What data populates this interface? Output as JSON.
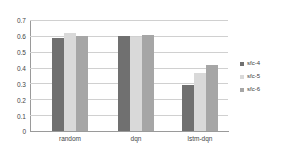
{
  "chart_data": {
    "type": "bar",
    "title": "",
    "subtitle": "",
    "xlabel": "",
    "ylabel": "",
    "categories": [
      "random",
      "dqn",
      "lstm-dqn"
    ],
    "series": [
      {
        "name": "sfc-4",
        "color": "#707070",
        "values": [
          0.585,
          0.6,
          0.29
        ]
      },
      {
        "name": "sfc-5",
        "color": "#d9d9d9",
        "values": [
          0.62,
          0.595,
          0.365
        ]
      },
      {
        "name": "sfc-6",
        "color": "#a6a6a6",
        "values": [
          0.6,
          0.605,
          0.415
        ]
      }
    ],
    "ylim": [
      0,
      0.7
    ],
    "ytick_labels": [
      "0",
      "0.1",
      "0.2",
      "0.3",
      "0.4",
      "0.5",
      "0.6",
      "0.7"
    ],
    "ytick_values": [
      0,
      0.1,
      0.2,
      0.3,
      0.4,
      0.5,
      0.6,
      0.7
    ],
    "grid": true,
    "grid_axis": "y",
    "legend_position": "right",
    "background_color": "#ffffff",
    "axis_color": "#9a9a9a",
    "grid_color": "#d0d0d0"
  }
}
